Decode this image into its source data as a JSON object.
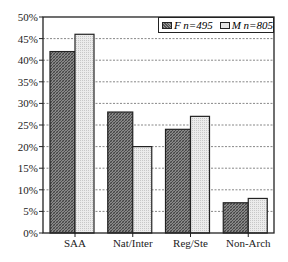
{
  "chart_data": {
    "type": "bar",
    "title": "",
    "xlabel": "",
    "ylabel": "",
    "categories": [
      "SAA",
      "Nat/Inter",
      "Reg/Ste",
      "Non-Arch"
    ],
    "series": [
      {
        "name": "F n=495",
        "values": [
          42,
          28,
          24,
          7
        ],
        "color": "#6e6e6e",
        "pattern": "dark crosshatch"
      },
      {
        "name": "M n=805",
        "values": [
          46,
          20,
          27,
          8
        ],
        "color": "#e4e4e4",
        "pattern": "light stipple"
      }
    ],
    "ylim": [
      0,
      50
    ],
    "yticks": [
      "0%",
      "5%",
      "10%",
      "15%",
      "20%",
      "25%",
      "30%",
      "35%",
      "40%",
      "45%",
      "50%"
    ],
    "grid": {
      "horizontal": true,
      "style": "dotted"
    },
    "legend": {
      "position": "top-right, inside plot",
      "entries": [
        "F n=495",
        "M n=805"
      ]
    }
  },
  "legend": {
    "f_label": "F n=495",
    "m_label": "M n=805"
  },
  "axis": {
    "y_ticks": [
      "50%",
      "45%",
      "40%",
      "35%",
      "30%",
      "25%",
      "20%",
      "15%",
      "10%",
      "5%",
      "0%"
    ],
    "x_labels": [
      "SAA",
      "Nat/Inter",
      "Reg/Ste",
      "Non-Arch"
    ]
  }
}
